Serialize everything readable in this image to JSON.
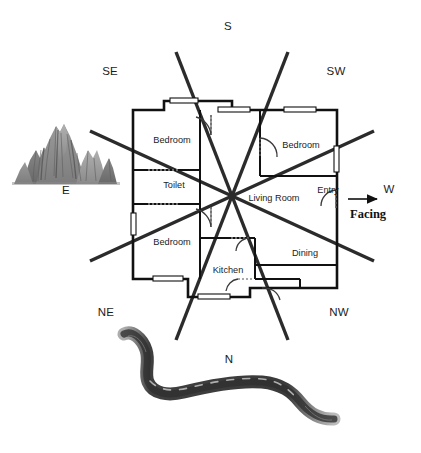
{
  "diagram": {
    "background": "#ffffff",
    "line_color": "#2b2b2b",
    "wall_color": "#111111"
  },
  "compass": {
    "labels": [
      {
        "key": "S",
        "text": "S",
        "x": 228,
        "y": 27
      },
      {
        "key": "SE",
        "text": "SE",
        "x": 110,
        "y": 72
      },
      {
        "key": "SW",
        "text": "SW",
        "x": 336,
        "y": 72
      },
      {
        "key": "E",
        "text": "E",
        "x": 66,
        "y": 191
      },
      {
        "key": "W",
        "text": "W",
        "x": 389,
        "y": 190
      },
      {
        "key": "NE",
        "text": "NE",
        "x": 106,
        "y": 313
      },
      {
        "key": "NW",
        "text": "NW",
        "x": 339,
        "y": 313
      },
      {
        "key": "N",
        "text": "N",
        "x": 229,
        "y": 360
      }
    ],
    "center": {
      "x": 232,
      "y": 196
    },
    "ray_count": 8
  },
  "facing": {
    "label": "Facing",
    "label_x": 350,
    "label_y": 208,
    "arrow_from_x": 348,
    "arrow_to_x": 378,
    "arrow_y": 199,
    "direction": "W"
  },
  "rooms": [
    {
      "name": "bedroom-top-left",
      "label": "Bedroom",
      "x": 150,
      "y": 141
    },
    {
      "name": "toilet",
      "label": "Toilet",
      "x": 159,
      "y": 186
    },
    {
      "name": "bedroom-bottom-left",
      "label": "Bedroom",
      "x": 150,
      "y": 243
    },
    {
      "name": "kitchen",
      "label": "Kitchen",
      "x": 219,
      "y": 271
    },
    {
      "name": "living-room",
      "label": "Living Room",
      "x": 245,
      "y": 199
    },
    {
      "name": "bedroom-top-right",
      "label": "Bedroom",
      "x": 283,
      "y": 146
    },
    {
      "name": "dining",
      "label": "Dining",
      "x": 292,
      "y": 254
    },
    {
      "name": "entry",
      "label": "Entry",
      "x": 316,
      "y": 191
    }
  ],
  "terrain": [
    {
      "name": "mountain",
      "caption": "E",
      "caption_x": 66,
      "caption_y": 191
    },
    {
      "name": "river",
      "caption": "N",
      "caption_x": 229,
      "caption_y": 360
    }
  ],
  "colors": {
    "mountain_light": "#a9a9a9",
    "mountain_mid": "#8d8d8d",
    "mountain_dark": "#5a5a5a",
    "river": "#4a4a4a",
    "window_fill": "#ffffff"
  }
}
